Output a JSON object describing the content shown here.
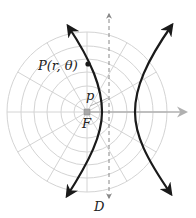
{
  "figure": {
    "labels": {
      "point": "P(r, θ)",
      "p": "p",
      "focus": "F",
      "directrix": "D"
    },
    "colors": {
      "curve": "#1a1a1a",
      "grid": "#d4d4d4",
      "axis": "#b0b0b0",
      "directrix": "#888888",
      "focus_marker": "#a8a8a8"
    },
    "focus": {
      "x": 87,
      "y": 112
    },
    "grid": {
      "ring_radii": [
        13,
        26,
        40,
        53,
        66,
        80
      ],
      "spoke_angles_deg": [
        0,
        30,
        60,
        90,
        120,
        150,
        180,
        210,
        240,
        270,
        300,
        330
      ]
    },
    "directrix_x": 109
  }
}
